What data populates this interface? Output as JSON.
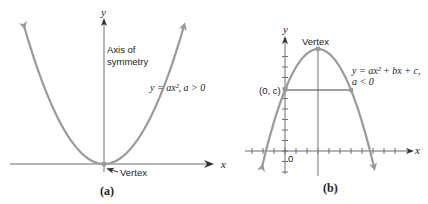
{
  "panels": [
    {
      "id": "a",
      "caption": "(a)",
      "x_axis_label": "x",
      "y_axis_label": "y",
      "axis_of_symmetry_label": [
        "Axis of",
        "symmetry"
      ],
      "equation": "y = ax², a > 0",
      "vertex_label": "Vertex",
      "opens": "up"
    },
    {
      "id": "b",
      "caption": "(b)",
      "x_axis_label": "x",
      "y_axis_label": "y",
      "origin_label": "0",
      "vertex_label": "Vertex",
      "y_intercept_label": "(0, c)",
      "equation": [
        "y = ax² + bx + c,",
        "a < 0"
      ],
      "opens": "down"
    }
  ],
  "colors": {
    "curve": "#9a9a9a",
    "axis": "#6e6e6e",
    "text": "#222222"
  }
}
